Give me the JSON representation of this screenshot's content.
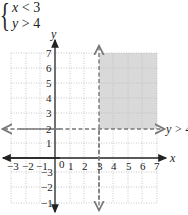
{
  "system": {
    "lines": [
      {
        "var": "x",
        "op": "<",
        "val": "3"
      },
      {
        "var": "y",
        "op": ">",
        "val": "4"
      }
    ]
  },
  "graph": {
    "x_axis_label": "x",
    "y_axis_label": "y",
    "x_ticks": [
      "−3",
      "−2",
      "−1",
      "0",
      "1",
      "2",
      "3",
      "4",
      "5",
      "6",
      "7"
    ],
    "y_ticks": [
      "−3",
      "−2",
      "−1",
      "1",
      "2",
      "3",
      "4",
      "5",
      "6",
      "7"
    ],
    "boundary_lines": [
      {
        "type": "vertical",
        "at": 3,
        "style": "dashed"
      },
      {
        "type": "horizontal",
        "at": 2,
        "style": "dashed",
        "label": "y > 4"
      }
    ],
    "shaded_region": {
      "x_from": 3,
      "x_to": 7,
      "y_from": 2,
      "y_to": 7,
      "color": "#d9d9d9"
    },
    "colors": {
      "axis": "#222222",
      "grid": "#bbbbbb",
      "dashed": "#777777",
      "shade": "#d9d9d9"
    }
  }
}
